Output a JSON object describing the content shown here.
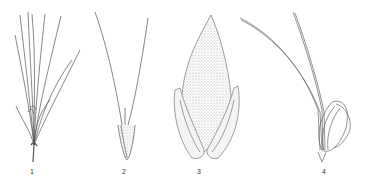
{
  "figure": {
    "panels": [
      {
        "id": 1,
        "label": "1",
        "subject": "tuft of slender leaves/culms"
      },
      {
        "id": 2,
        "label": "2",
        "subject": "spikelet with two long awns"
      },
      {
        "id": 3,
        "label": "3",
        "subject": "ovate hairy lemma with glumes"
      },
      {
        "id": 4,
        "label": "4",
        "subject": "floret with curved awns"
      }
    ]
  },
  "colors": {
    "ink": "#555555",
    "stipple": "#8a8a8a",
    "background": "#ffffff"
  }
}
